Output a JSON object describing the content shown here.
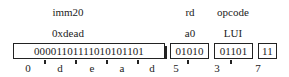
{
  "fields": [
    {
      "name": "imm20",
      "value": "0xdead",
      "bits": "00001101111010101101",
      "hex_digits": [
        "0",
        "d",
        "e",
        "a",
        "d"
      ]
    },
    {
      "name": "rd",
      "value": "a0",
      "bits": "01010",
      "hex_digits": [
        "5"
      ]
    },
    {
      "name": "opcode",
      "value": "LUI",
      "bits": "01101",
      "hex_digits": [
        "3"
      ]
    },
    {
      "name": "",
      "value": "",
      "bits": "11",
      "hex_digits": [
        "7"
      ]
    }
  ],
  "nibble_labels": [
    "0",
    "d",
    "e",
    "a",
    "d",
    "5",
    "3",
    "7"
  ]
}
